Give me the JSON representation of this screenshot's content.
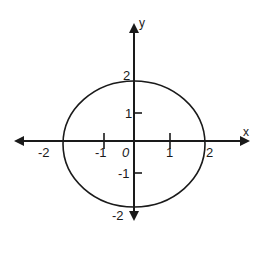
{
  "figure": {
    "title": "",
    "x_axis_label": "x",
    "y_axis_label": "y",
    "origin_label": "0",
    "x_ticks": [
      {
        "value": -2,
        "label": "-2"
      },
      {
        "value": -1,
        "label": "-1"
      },
      {
        "value": 1,
        "label": "1"
      },
      {
        "value": 2,
        "label": "2"
      }
    ],
    "y_ticks": [
      {
        "value": 2,
        "label": "2"
      },
      {
        "value": 1,
        "label": "1"
      },
      {
        "value": -1,
        "label": "-1"
      },
      {
        "value": -2,
        "label": "-2"
      }
    ],
    "curve": {
      "type": "circle",
      "center": [
        0,
        0
      ],
      "radius": 2,
      "equation": "x^2 + y^2 = 4"
    },
    "colors": {
      "stroke": "#1a1a1a",
      "background": "#ffffff"
    }
  }
}
